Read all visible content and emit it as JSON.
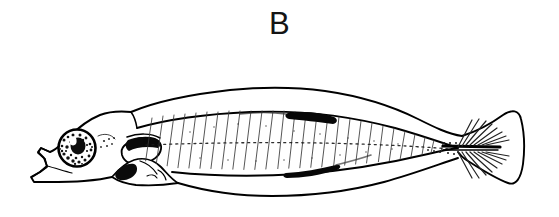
{
  "figure": {
    "panel_label": "B",
    "caption_visible": false,
    "background_color": "#ffffff",
    "ink_color": "#000000",
    "width": 559,
    "height": 217
  },
  "illustration": {
    "title": "Lateral view line drawing of a fish larva",
    "style": "ink line drawing with stippling and solid black melanophores",
    "orientation": "head-left, tail-right",
    "parts": [
      {
        "name": "head",
        "label": "head",
        "description": "Blunt rounded head with pointed snout and lower jaw at left end of body"
      },
      {
        "name": "eye",
        "label": "eye",
        "description": "Large round eye with dark outer ring, stippled mottled iris, solid dark pupil and white highlight"
      },
      {
        "name": "snout",
        "label": "snout and jaw",
        "description": "Angular pointed snout with open mouth cleft and projecting lower jaw"
      },
      {
        "name": "pectoral-fin",
        "label": "pectoral fin",
        "description": "Rounded pectoral fin lobe behind the head with dark pigment along its upper margin"
      },
      {
        "name": "gut",
        "label": "gut and abdomen",
        "description": "Bulging ventral gut mass below the pectoral region with a solid black pigment blotch"
      },
      {
        "name": "myomeres",
        "label": "myomeres",
        "description": "Series of chevron muscle segments drawn as slanted parallel lines along the trunk"
      },
      {
        "name": "lateral-line",
        "label": "lateral midline",
        "description": "Dotted horizontal midline running from behind the head to the tail"
      },
      {
        "name": "dorsal-finfold",
        "label": "dorsal finfold",
        "description": "Continuous arched median finfold along the back from nape to caudal fin"
      },
      {
        "name": "ventral-finfold",
        "label": "ventral finfold",
        "description": "Continuous median finfold along the belly from behind the gut to the caudal fin"
      },
      {
        "name": "dorsal-melanophore-patch",
        "label": "dorsal pigment patch",
        "description": "Elongate solid black melanophore patch on the dorsal trunk margin"
      },
      {
        "name": "ventral-melanophore-streak",
        "label": "ventral pigment streak",
        "description": "Elongate solid black melanophore streak along the ventral trunk margin"
      },
      {
        "name": "notochord",
        "label": "notochord",
        "description": "Straight rod running through the caudal peduncle to the base of the caudal fin"
      },
      {
        "name": "caudal-fin",
        "label": "caudal fin",
        "description": "Rounded paddle-shaped caudal fin with a radiating fan of fin rays"
      },
      {
        "name": "caudal-fin-rays",
        "label": "caudal fin rays",
        "description": "Fan of fine straight rays radiating dorsally and ventrally from the notochord tip"
      }
    ]
  }
}
